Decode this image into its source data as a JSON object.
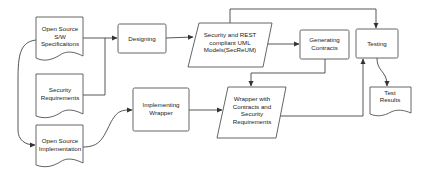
{
  "diagram": {
    "nodes": [
      {
        "id": "spec",
        "shape": "document",
        "lines": [
          "Open Source",
          "S/W",
          "Specificaitons"
        ]
      },
      {
        "id": "secreq",
        "shape": "document",
        "lines": [
          "Security",
          "Requirements"
        ]
      },
      {
        "id": "impl",
        "shape": "document",
        "lines": [
          "Open Source",
          "Implementation"
        ]
      },
      {
        "id": "designing",
        "shape": "rectangle",
        "lines": [
          "Designing"
        ]
      },
      {
        "id": "uml",
        "shape": "parallelogram",
        "lines": [
          "Security and REST",
          "compliant UML",
          "Models(SecReUM)"
        ]
      },
      {
        "id": "gencontracts",
        "shape": "rectangle",
        "lines": [
          "Generating",
          "Contracts"
        ]
      },
      {
        "id": "testing",
        "shape": "rectangle",
        "lines": [
          "Testing"
        ]
      },
      {
        "id": "results",
        "shape": "document",
        "lines": [
          "Test",
          "Results"
        ]
      },
      {
        "id": "implwrapper",
        "shape": "rectangle",
        "lines": [
          "Implementing",
          "Wrapper"
        ]
      },
      {
        "id": "wrapper",
        "shape": "parallelogram",
        "lines": [
          "Wrapper with",
          "Contracts and",
          "Security",
          "Requirements"
        ]
      }
    ],
    "edges": [
      {
        "from": "spec",
        "to": "designing"
      },
      {
        "from": "secreq",
        "to": "designing"
      },
      {
        "from": "designing",
        "to": "uml"
      },
      {
        "from": "uml",
        "to": "gencontracts"
      },
      {
        "from": "uml",
        "to": "testing"
      },
      {
        "from": "gencontracts",
        "to": "wrapper"
      },
      {
        "from": "spec",
        "to": "impl"
      },
      {
        "from": "impl",
        "to": "implwrapper"
      },
      {
        "from": "implwrapper",
        "to": "wrapper"
      },
      {
        "from": "wrapper",
        "to": "testing"
      },
      {
        "from": "testing",
        "to": "results"
      }
    ]
  }
}
